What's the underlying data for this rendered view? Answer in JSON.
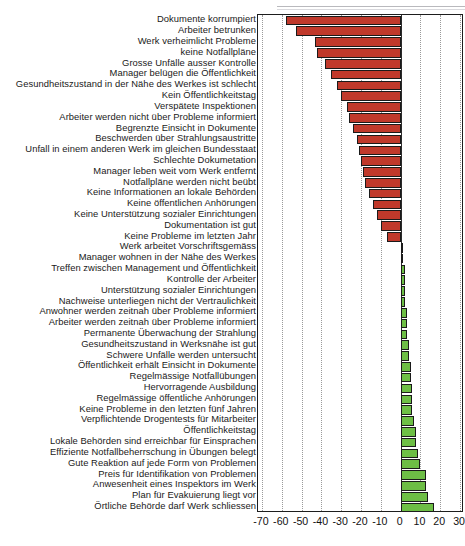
{
  "chart_data": {
    "type": "bar",
    "orientation": "horizontal",
    "title": "",
    "subtitle": "",
    "xlabel": "",
    "ylabel": "",
    "xlim": [
      -72,
      32
    ],
    "xticks": [
      -70,
      -60,
      -50,
      -40,
      -30,
      -20,
      -10,
      0,
      10,
      20,
      30
    ],
    "xtick_labels": [
      "-70",
      "-60",
      "-50",
      "-40",
      "-30",
      "-20",
      "-10",
      "0",
      "10",
      "20",
      "30"
    ],
    "grid": "vertical-dotted",
    "legend": "none",
    "colors": {
      "negative": "#C0392B",
      "positive": "#6DBE45",
      "bar_edge": "#1A1A1A",
      "axis": "#1D1D1D",
      "gridline": "#9A9A9A"
    },
    "categories": [
      "Dokumente korrumpiert",
      "Arbeiter betrunken",
      "Werk verheimlicht Probleme",
      "keine Notfallpläne",
      "Grosse Unfälle ausser Kontrolle",
      "Manager belügen die Öffentlichkeit",
      "Gesundheitszustand in der Nähe des Werkes ist schlecht",
      "Kein Öffentlichkeitstag",
      "Verspätete Inspektionen",
      "Arbeiter werden nicht über Probleme informiert",
      "Begrenzte Einsicht in Dokumente",
      "Beschwerden über Strahlungsaustritte",
      "Unfall in einem anderen Werk im gleichen Bundesstaat",
      "Schlechte Dokumetation",
      "Manager leben weit vom Werk entfernt",
      "Notfallpläne werden nicht beübt",
      "Keine Informationen an lokale Behörden",
      "Keine öffentlichen Anhörungen",
      "Keine Unterstützung sozialer Einrichtungen",
      "Dokumentation ist gut",
      "Keine Probleme im letzten Jahr",
      "Werk arbeitet Vorschriftsgemäss",
      "Manager wohnen in der Nähe des Werkes",
      "Treffen zwischen Management und Öffentlichkeit",
      "Kontrolle der Arbeiter",
      "Unterstützung sozialer Einrichtungen",
      "Nachweise unterliegen nicht der Vertraulichkeit",
      "Anwohner werden zeitnah über Probleme informiert",
      "Arbeiter werden zeitnah über Probleme informiert",
      "Permanente Überwachung der Strahlung",
      "Gesundheitszustand in Werksnähe ist gut",
      "Schwere Unfälle werden untersucht",
      "Öffentlichkeit erhält Einsicht in Dokumente",
      "Regelmässige Notfallübungen",
      "Hervorragende Ausbildung",
      "Regelmässige öffentliche Anhörungen",
      "Keine Probleme in den letzten fünf Jahren",
      "Verpflichtende Drogentests für Mitarbeiter",
      "Öffentlichkeitstag",
      "Lokale Behörden sind erreichbar für Einsprachen",
      "Effiziente Notfallbeherrschung in Übungen belegt",
      "Gute Reaktion auf jede Form von Problemen",
      "Preis für Identifikation von Problemen",
      "Anwesenheit eines Inspektors im Werk",
      "Plan für Evakuierung liegt vor",
      "Örtliche Behörde darf Werk schliessen"
    ],
    "values": [
      -58,
      -53,
      -43,
      -42,
      -38,
      -35,
      -32,
      -30,
      -27,
      -26,
      -24,
      -22,
      -21,
      -20,
      -19,
      -18,
      -16,
      -14,
      -12,
      -10,
      -7,
      1,
      1,
      2,
      2,
      2,
      2,
      3,
      3,
      3,
      4,
      4,
      5,
      5,
      6,
      6,
      6,
      7,
      8,
      8,
      9,
      10,
      13,
      13,
      14,
      17
    ]
  }
}
